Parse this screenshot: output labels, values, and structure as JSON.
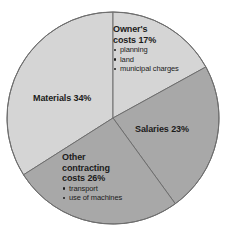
{
  "chart_data": {
    "type": "pie",
    "title": "",
    "subtitle": "",
    "xlabel": "",
    "ylabel": "",
    "legend_position": "inside-slices",
    "grid": false,
    "total_percent": 100,
    "categories": [
      "Materials",
      "Owner's costs",
      "Salaries",
      "Other contracting costs"
    ],
    "values": [
      34,
      17,
      23,
      26
    ],
    "slices": [
      {
        "name": "Owner's costs",
        "label_line_1": "Owner's",
        "label_line_2": "costs 17%",
        "value": 17,
        "unit": "%",
        "color": "#d5d5d5",
        "start_angle_deg": 0,
        "end_angle_deg": 61.2,
        "sub_items": [
          "planning",
          "land",
          "municipal charges"
        ]
      },
      {
        "name": "Salaries",
        "label_line_1": "Salaries 23%",
        "label_line_2": "",
        "value": 23,
        "unit": "%",
        "color": "#a8a8a8",
        "start_angle_deg": 61.2,
        "end_angle_deg": 144.0,
        "sub_items": []
      },
      {
        "name": "Other contracting costs",
        "label_line_1": "Other",
        "label_line_2": "contracting",
        "label_line_3": "costs 26%",
        "value": 26,
        "unit": "%",
        "color": "#a8a8a8",
        "start_angle_deg": 144.0,
        "end_angle_deg": 237.6,
        "sub_items": [
          "transport",
          "use of machines"
        ]
      },
      {
        "name": "Materials",
        "label_line_1": "Materials 34%",
        "label_line_2": "",
        "value": 34,
        "unit": "%",
        "color": "#d5d5d5",
        "start_angle_deg": 237.6,
        "end_angle_deg": 360,
        "sub_items": []
      }
    ],
    "colors": {
      "light_gray": "#d5d5d5",
      "medium_gray": "#a8a8a8",
      "outline": "#6e6e6e",
      "text": "#1b1b1b",
      "background": "#ffffff"
    }
  }
}
